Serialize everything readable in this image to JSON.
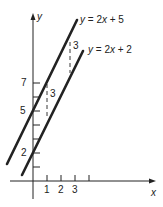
{
  "diagram": {
    "axes": {
      "x_label": "x",
      "y_label": "y",
      "x_ticks": [
        1,
        2,
        3,
        4
      ],
      "x_tick_labels": [
        "1",
        "2",
        "3"
      ],
      "y_ticks": [
        1,
        2,
        3,
        4,
        5,
        6,
        7
      ],
      "y_tick_labels": [
        "2",
        "5",
        "7"
      ]
    },
    "lines": [
      {
        "name": "line-y-2x-plus-5",
        "label": "y = 2x + 5",
        "slope": 2,
        "intercept": 5
      },
      {
        "name": "line-y-2x-plus-2",
        "label": "y = 2x + 2",
        "slope": 2,
        "intercept": 2
      }
    ],
    "gap_annotations": [
      {
        "x": 1,
        "label": "3"
      },
      {
        "x": 2.7,
        "label": "3"
      }
    ],
    "colors": {
      "ink": "#222222",
      "background": "#ffffff"
    }
  },
  "labels": {
    "x_axis": "x",
    "y_axis": "y",
    "eq1_prefix": "y",
    "eq1_rest": " = 2",
    "eq1_var": "x",
    "eq1_tail": " + 5",
    "eq2_prefix": "y",
    "eq2_rest": " = 2",
    "eq2_var": "x",
    "eq2_tail": " + 2",
    "tick_x1": "1",
    "tick_x2": "2",
    "tick_x3": "3",
    "tick_y2": "2",
    "tick_y5": "5",
    "tick_y7": "7",
    "gap_left": "3",
    "gap_right": "3"
  }
}
